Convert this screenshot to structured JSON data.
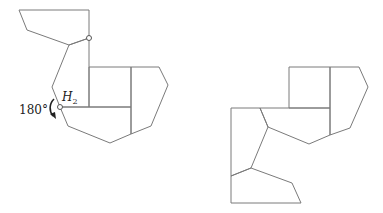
{
  "figure": {
    "left": {
      "rotation_label": "180°",
      "pivot_label_base": "H",
      "pivot_label_sub": "2",
      "arrow_icon": "curved-rotation-arrow-icon"
    },
    "right": {}
  },
  "colors": {
    "edge": "#7a7a7a",
    "text": "#222222",
    "background": "#ffffff"
  }
}
